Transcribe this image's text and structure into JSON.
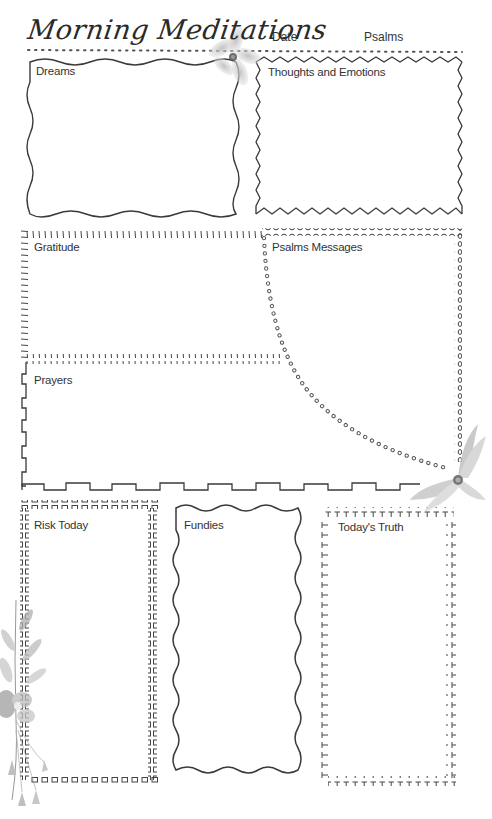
{
  "page": {
    "title": "Morning Meditations",
    "header_fields": {
      "date_label": "Date",
      "psalms_label": "Psalms"
    }
  },
  "sections": {
    "dreams": {
      "label": "Dreams",
      "border": "wavy"
    },
    "thoughts": {
      "label": "Thoughts and Emotions",
      "border": "zigzag"
    },
    "gratitude": {
      "label": "Gratitude",
      "border": "tick-marks"
    },
    "psalms_messages": {
      "label": "Psalms Messages",
      "border": "dotted-circles"
    },
    "prayers": {
      "label": "Prayers",
      "border": "square-wave"
    },
    "risk_today": {
      "label": "Risk Today",
      "border": "small-squares"
    },
    "fundies": {
      "label": "Fundies",
      "border": "wavy"
    },
    "todays_truth": {
      "label": "Today's Truth",
      "border": "t-marks"
    }
  },
  "decorations": {
    "icons": [
      "flower-icon-top",
      "flower-icon-middle-right",
      "floral-sprig-icon-bottom-left"
    ]
  },
  "colors": {
    "ink": "#3a3a3a",
    "flower": "#9a9a9a",
    "background": "#ffffff"
  }
}
